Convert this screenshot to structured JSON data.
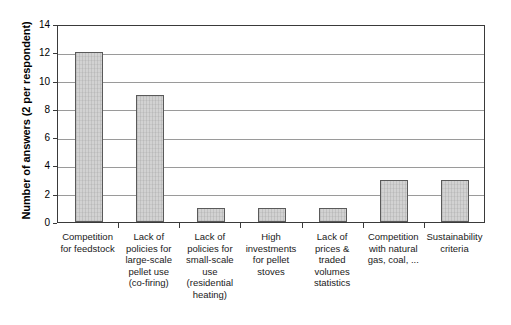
{
  "chart_data": {
    "type": "bar",
    "title": "",
    "subtitle": "",
    "xlabel": "",
    "ylabel": "Number of answers (2 per respondent)",
    "ylim": [
      0,
      14
    ],
    "ytick_step": 2,
    "yticks": [
      14,
      12,
      10,
      8,
      6,
      4,
      2,
      0
    ],
    "grid": "horizontal",
    "legend": "none",
    "bar_fill_color": "#d2d2d2",
    "bar_border_color": "#5a5a5a",
    "gridline_color": "#9a9a9a",
    "axis_color": "#3a3a3a",
    "categories": [
      "Competition for feedstock",
      "Lack of policies for large-scale pellet use (co-firing)",
      "Lack of policies for small-scale use (residential heating)",
      "High investments for pellet stoves",
      "Lack of prices & traded volumes statistics",
      "Competition with natural gas, coal, ...",
      "Sustainability criteria"
    ],
    "category_lines": [
      [
        "Competition",
        "for feedstock"
      ],
      [
        "Lack of",
        "policies for",
        "large-scale",
        "pellet use",
        "(co-firing)"
      ],
      [
        "Lack of",
        "policies for",
        "small-scale",
        "use",
        "(residential",
        "heating)"
      ],
      [
        "High",
        "investments",
        "for pellet",
        "stoves"
      ],
      [
        "Lack of",
        "prices &",
        "traded",
        "volumes",
        "statistics"
      ],
      [
        "Competition",
        "with natural",
        "gas, coal, ..."
      ],
      [
        "Sustainability",
        "criteria"
      ]
    ],
    "values": [
      12,
      9,
      1,
      1,
      1,
      3,
      3
    ]
  }
}
